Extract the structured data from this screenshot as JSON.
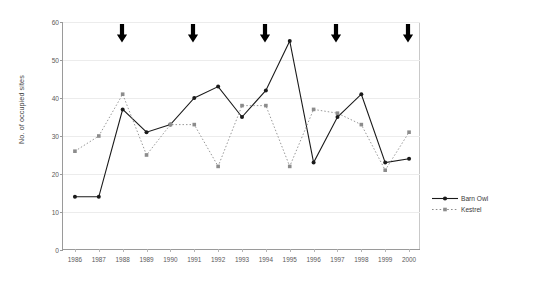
{
  "chart_data": {
    "type": "line",
    "title": "",
    "xlabel": "",
    "ylabel": "No. of occupied sites",
    "categories": [
      "1986",
      "1987",
      "1988",
      "1989",
      "1990",
      "1991",
      "1992",
      "1993",
      "1994",
      "1995",
      "1996",
      "1997",
      "1998",
      "1999",
      "2000"
    ],
    "ylim": [
      0,
      60
    ],
    "yticks": [
      0,
      10,
      20,
      30,
      40,
      50,
      60
    ],
    "grid": true,
    "legend_position": "right",
    "series": [
      {
        "name": "Barn Owl",
        "style": "solid",
        "marker": "filled-circle",
        "color": "#1a1a1a",
        "values": [
          14,
          14,
          37,
          31,
          33,
          40,
          43,
          35,
          42,
          55,
          23,
          35,
          41,
          23,
          24
        ]
      },
      {
        "name": "Kestrel",
        "style": "dotted",
        "marker": "filled-square",
        "color": "#8c8c8c",
        "values": [
          26,
          30,
          41,
          25,
          33,
          33,
          22,
          38,
          38,
          22,
          37,
          36,
          33,
          21,
          31
        ]
      }
    ],
    "annotations": {
      "type": "down-arrow",
      "color": "#000000",
      "at_categories": [
        "1988",
        "1991",
        "1994",
        "1997",
        "2000"
      ]
    }
  },
  "legend": {
    "items": [
      {
        "label": "Barn Owl",
        "icon": "solid-line-circle-marker"
      },
      {
        "label": "Kestrel",
        "icon": "dotted-line-square-marker"
      }
    ]
  }
}
